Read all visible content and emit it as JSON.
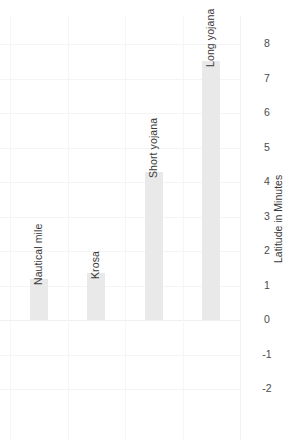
{
  "chart_data": {
    "type": "bar",
    "orientation": "rotated-vertical",
    "title": "",
    "subtitle": "",
    "xlabel": "",
    "ylabel": "Latitude in Minutes",
    "categories": [
      "Nautical mile",
      "Krosa",
      "Short yojana",
      "Long yojana"
    ],
    "values": [
      1.2,
      1.35,
      4.3,
      7.5
    ],
    "series": [
      {
        "name": "Latitude in Minutes",
        "values": [
          1.2,
          1.35,
          4.3,
          7.5
        ]
      }
    ],
    "ylim": [
      -2,
      8
    ],
    "tick_labels": [
      "8",
      "7",
      "6",
      "5",
      "4",
      "3",
      "2",
      "1",
      "0",
      "-1",
      "-2"
    ],
    "tick_values": [
      8,
      7,
      6,
      5,
      4,
      3,
      2,
      1,
      0,
      -1,
      -2
    ],
    "grid": true,
    "legend": "none",
    "bar_color": "#e9e9ea",
    "grid_color": "#f4f4f6",
    "text_color": "#3a3a3a",
    "background": "#ffffff"
  },
  "axis": {
    "title": "Latitude in Minutes",
    "ticks": [
      {
        "label": "8",
        "value": 8
      },
      {
        "label": "7",
        "value": 7
      },
      {
        "label": "6",
        "value": 6
      },
      {
        "label": "5",
        "value": 5
      },
      {
        "label": "4",
        "value": 4
      },
      {
        "label": "3",
        "value": 3
      },
      {
        "label": "2",
        "value": 2
      },
      {
        "label": "1",
        "value": 1
      },
      {
        "label": "0",
        "value": 0
      },
      {
        "label": "-1",
        "value": -1
      },
      {
        "label": "-2",
        "value": -2
      }
    ]
  },
  "bars": [
    {
      "label": "Nautical mile",
      "value": 1.2
    },
    {
      "label": "Krosa",
      "value": 1.35
    },
    {
      "label": "Short yojana",
      "value": 4.3
    },
    {
      "label": "Long yojana",
      "value": 7.5
    }
  ]
}
